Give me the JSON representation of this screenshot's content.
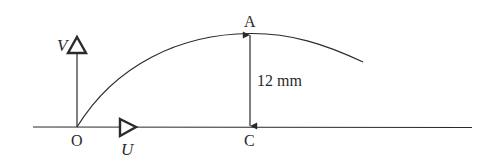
{
  "diagram": {
    "labels": {
      "origin": "O",
      "peak": "A",
      "foot": "C",
      "vertical_velocity": "V",
      "horizontal_velocity": "U",
      "height": "12 mm"
    },
    "colors": {
      "stroke": "#2a2a2a",
      "background": "#ffffff"
    }
  }
}
